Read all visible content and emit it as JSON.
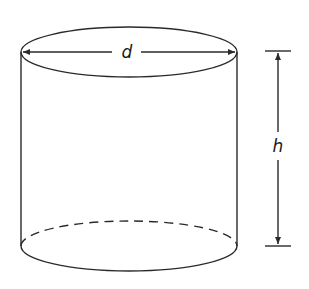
{
  "diagram": {
    "shape": "cylinder",
    "labels": {
      "diameter": "d",
      "height": "h"
    },
    "colors": {
      "stroke": "#2a2a2a",
      "background": "#ffffff"
    }
  }
}
